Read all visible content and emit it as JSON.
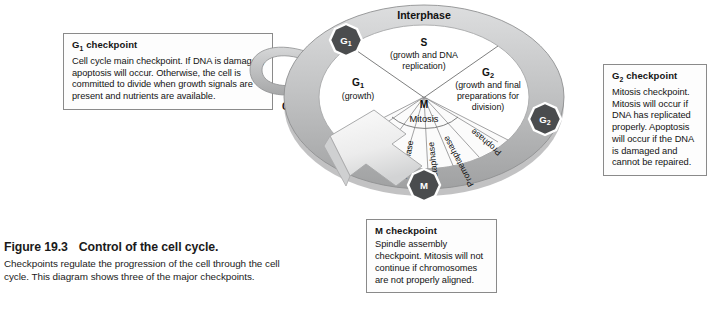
{
  "figure": {
    "number": "Figure 19.3",
    "title": "Control of the cell cycle.",
    "caption": "Checkpoints regulate the progression of the cell through the cell cycle. This diagram shows three of the major checkpoints."
  },
  "callouts": {
    "g1": {
      "title": "G₁ checkpoint",
      "body": "Cell cycle main checkpoint. If DNA is damaged, apoptosis will occur. Otherwise, the cell is committed to divide when growth signals are present and nutrients are available."
    },
    "g2": {
      "title": "G₂ checkpoint",
      "body": "Mitosis checkpoint. Mitosis will occur if DNA has replicated properly. Apoptosis will occur if the DNA is damaged and cannot be repaired."
    },
    "m": {
      "title": "M checkpoint",
      "body": "Spindle assembly checkpoint. Mitosis will not continue if chromosomes are not properly aligned."
    }
  },
  "diagram": {
    "ring_label": "Interphase",
    "g0_label": "G₀",
    "mitosis_label": "Mitosis",
    "phases": [
      {
        "name": "G₁",
        "detail": "(growth)"
      },
      {
        "name": "S",
        "detail": "(growth and DNA replication)"
      },
      {
        "name": "G₂",
        "detail": "(growth and final preparations for division)"
      },
      {
        "name": "M",
        "detail": ""
      }
    ],
    "s_detail_line1": "(growth and DNA",
    "s_detail_line2": "replication)",
    "g2_detail_line1": "(growth and final",
    "g2_detail_line2": "preparations for",
    "g2_detail_line3": "division)",
    "mitosis_stages": [
      "Cytokinesis",
      "Telophase",
      "Anaphase",
      "Metaphase",
      "Prometaphase",
      "Prophase"
    ],
    "checkpoint_badges": [
      {
        "id": "g1",
        "label": "G₁"
      },
      {
        "id": "g2",
        "label": "G₂"
      },
      {
        "id": "m",
        "label": "M"
      }
    ]
  },
  "colors": {
    "ring_light": "#cfd0d1",
    "ring_mid": "#b9babb",
    "ring_dark": "#9a9b9c",
    "badge_fill": "#4a4c4e",
    "arrow_fill": "#f2f2f2",
    "text": "#141414",
    "box_border": "#8a8a8a"
  }
}
